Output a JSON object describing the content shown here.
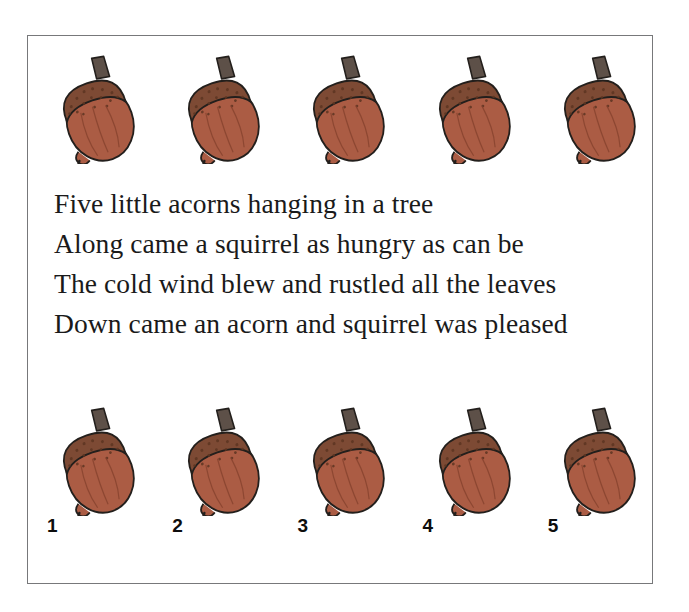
{
  "worksheet": {
    "title": "Five Little Acorns",
    "frame_color": "#77787a",
    "background": "#ffffff"
  },
  "illustration": {
    "icon_name": "acorn-icon",
    "count_per_row": 5,
    "colors": {
      "body": "#ab5c44",
      "body_shade": "#9c5039",
      "cap": "#7d4a34",
      "cap_speckle": "#5d3522",
      "stem": "#5d5048",
      "outline": "#231f1c"
    }
  },
  "top_row": {
    "label": "top-acorn-row",
    "acorns": [
      {
        "name": "acorn-top-1"
      },
      {
        "name": "acorn-top-2"
      },
      {
        "name": "acorn-top-3"
      },
      {
        "name": "acorn-top-4"
      },
      {
        "name": "acorn-top-5"
      }
    ]
  },
  "bottom_row": {
    "label": "bottom-acorn-row",
    "acorns": [
      {
        "number": "1"
      },
      {
        "number": "2"
      },
      {
        "number": "3"
      },
      {
        "number": "4"
      },
      {
        "number": "5"
      }
    ]
  },
  "poem": {
    "lines": [
      "Five little acorns hanging in a tree",
      "Along came a squirrel as hungry as can be",
      "The cold wind blew and rustled all the leaves",
      "Down came an acorn and squirrel was pleased"
    ]
  }
}
